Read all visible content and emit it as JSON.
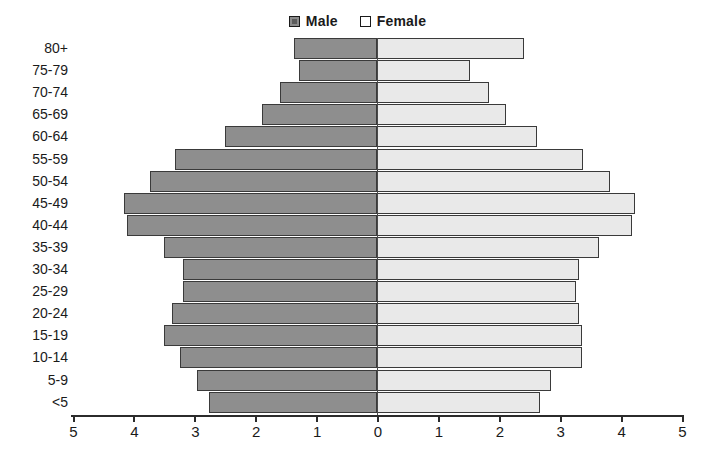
{
  "legend": {
    "position": "top-center",
    "entries": [
      {
        "label": "Male",
        "icon": "square-swatch-male-icon",
        "color": "#8e8e8e"
      },
      {
        "label": "Female",
        "icon": "square-swatch-female-icon",
        "color": "#e9e9e9"
      }
    ]
  },
  "axis": {
    "x_tick_labels": [
      "5",
      "4",
      "3",
      "2",
      "1",
      "0",
      "1",
      "2",
      "3",
      "4",
      "5"
    ],
    "x_tick_values": [
      -5,
      -4,
      -3,
      -2,
      -1,
      0,
      1,
      2,
      3,
      4,
      5
    ]
  },
  "chart_data": {
    "type": "bar",
    "subtype": "population-pyramid",
    "title": "",
    "subtitle": "",
    "xlabel": "",
    "ylabel": "",
    "xlim": [
      -5,
      5
    ],
    "grid": false,
    "legend_position": "top-center",
    "orientation": "horizontal",
    "categories": [
      "80+",
      "75-79",
      "70-74",
      "65-69",
      "60-64",
      "55-59",
      "50-54",
      "45-49",
      "40-44",
      "35-39",
      "30-34",
      "25-29",
      "20-24",
      "15-19",
      "10-14",
      "5-9",
      "<5"
    ],
    "series": [
      {
        "name": "Male",
        "color": "#8e8e8e",
        "side": "left",
        "values": [
          1.36,
          1.28,
          1.6,
          1.89,
          2.5,
          3.31,
          3.72,
          4.16,
          4.11,
          3.49,
          3.19,
          3.18,
          3.37,
          3.49,
          3.24,
          2.96,
          2.76
        ]
      },
      {
        "name": "Female",
        "color": "#e9e9e9",
        "side": "right",
        "values": [
          2.42,
          1.53,
          1.84,
          2.12,
          2.63,
          3.39,
          3.83,
          4.24,
          4.19,
          3.65,
          3.31,
          3.27,
          3.32,
          3.36,
          3.37,
          2.85,
          2.68
        ]
      }
    ]
  }
}
